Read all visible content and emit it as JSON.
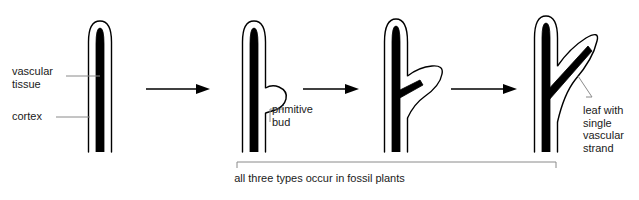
{
  "diagram": {
    "background_color": "#ffffff",
    "ink_color": "#000000",
    "leader_color": "#8a8a8a",
    "text_color": "#1a1a1a",
    "stages": [
      {
        "id": "stage-1",
        "name": "simple-axis",
        "description": "simple cylindrical axis with central vascular strand"
      },
      {
        "id": "stage-2",
        "name": "axis-with-primitive-bud",
        "description": "axis bearing a small rounded lateral outgrowth"
      },
      {
        "id": "stage-3",
        "name": "axis-with-enlarged-outgrowth",
        "description": "enlarged lateral outgrowth with vascular tissue entering its base"
      },
      {
        "id": "stage-4",
        "name": "leaf-with-vascular-strand",
        "description": "fully formed leaf with a single vascular strand running its length"
      }
    ],
    "arrows": [
      {
        "id": "arrow-1",
        "name": "arrow-stage1-to-stage2"
      },
      {
        "id": "arrow-2",
        "name": "arrow-stage2-to-stage3"
      },
      {
        "id": "arrow-3",
        "name": "arrow-stage3-to-stage4"
      }
    ],
    "labels": {
      "vascular_tissue": "vascular\ntissue",
      "cortex": "cortex",
      "primitive_bud": "primitive\nbud",
      "leaf_with_single_vascular_strand": "leaf with\nsingle\nvascular\nstrand"
    },
    "bracket": {
      "caption": "all three types occur in fossil plants",
      "spans_stages": [
        "stage-2",
        "stage-3",
        "stage-4"
      ]
    }
  }
}
